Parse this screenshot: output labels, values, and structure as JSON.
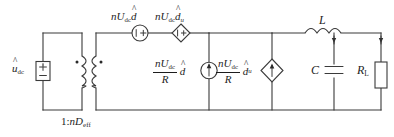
{
  "diagram": {
    "type": "small-signal-equivalent-circuit",
    "title_visible": false,
    "stroke_color": "#3a3a3a",
    "text_color": "#1d1d1d",
    "background": "#ffffff"
  },
  "labels": {
    "input_source": {
      "base": "u",
      "sub": "dc",
      "hat": true,
      "text": "û_dc"
    },
    "transformer_ratio": {
      "prefix": "1:",
      "italic_n": "n",
      "base": "D",
      "sub": "eff",
      "text": "1:nD_eff"
    },
    "series_voltage_source_1": {
      "coef": "nU",
      "coef_sub": "dc",
      "var": "d",
      "var_sub": "",
      "hat": true,
      "text": "nU_dc d̂"
    },
    "series_voltage_source_2": {
      "coef": "nU",
      "coef_sub": "dc",
      "var": "d",
      "var_sub": "u",
      "hat": true,
      "text": "nU_dc d̂_u"
    },
    "current_source_1": {
      "num_coef": "nU",
      "num_sub": "dc",
      "den": "R",
      "var": "d",
      "var_sub": "",
      "hat": true,
      "text": "(nU_dc / R) d̂"
    },
    "current_source_2": {
      "num_coef": "nU",
      "num_sub": "dc",
      "den": "R",
      "var": "d",
      "var_sub": "u",
      "hat": true,
      "text": "(nU_dc / R) d̂_u"
    },
    "inductor": {
      "text": "L"
    },
    "capacitor": {
      "text": "C"
    },
    "load_resistor": {
      "base": "R",
      "sub": "L",
      "text": "R_L"
    }
  },
  "components": [
    {
      "name": "input-voltage-source",
      "kind": "independent-voltage-source",
      "label": "û_dc",
      "polarity_top": "+",
      "polarity_bottom": "−"
    },
    {
      "name": "transformer",
      "kind": "ideal-transformer",
      "label": "1:nD_eff",
      "dot_markers": 2
    },
    {
      "name": "voltage-source-d",
      "kind": "independent-voltage-source-circle",
      "label": "nU_dc d̂",
      "polarity": "+"
    },
    {
      "name": "dependent-voltage-source-du",
      "kind": "dependent-voltage-source-diamond",
      "label": "nU_dc d̂_u",
      "polarity": "+"
    },
    {
      "name": "current-source-d",
      "kind": "independent-current-source-circle",
      "label": "(nU_dc / R) d̂",
      "arrow": "up"
    },
    {
      "name": "dependent-current-source-du",
      "kind": "dependent-current-source-diamond",
      "label": "(nU_dc / R) d̂_u",
      "arrow": "up"
    },
    {
      "name": "inductor-L",
      "kind": "inductor",
      "label": "L"
    },
    {
      "name": "capacitor-C",
      "kind": "capacitor",
      "label": "C"
    },
    {
      "name": "load-resistor-RL",
      "kind": "resistor",
      "label": "R_L"
    }
  ]
}
